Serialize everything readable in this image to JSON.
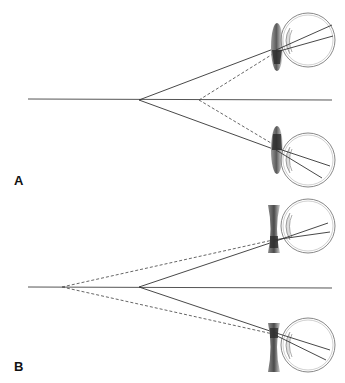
{
  "figure": {
    "panels": [
      {
        "id": "A",
        "label": "A",
        "lens_type": "convex",
        "description": "Convex (plus) lens converging rays toward the eye"
      },
      {
        "id": "B",
        "label": "B",
        "lens_type": "concave",
        "description": "Concave (minus) lens diverging rays toward the eye"
      }
    ],
    "colors": {
      "line": "#333333",
      "dashed": "#555555",
      "lens_dark": "#444444",
      "lens_light": "#e0e0e0",
      "eye_outline": "#888888"
    }
  }
}
